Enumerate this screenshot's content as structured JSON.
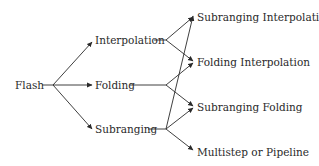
{
  "diagram": {
    "root": {
      "label": "Flash"
    },
    "middle": [
      {
        "label": "Interpolation"
      },
      {
        "label": "Folding"
      },
      {
        "label": "Subranging"
      }
    ],
    "leaves": [
      {
        "label": "Subranging Interpolation"
      },
      {
        "label": "Folding Interpolation"
      },
      {
        "label": "Subranging Folding"
      },
      {
        "label": "Multistep or Pipeline"
      }
    ],
    "edges": [
      {
        "from": "Flash",
        "to": "Interpolation"
      },
      {
        "from": "Flash",
        "to": "Folding"
      },
      {
        "from": "Flash",
        "to": "Subranging"
      },
      {
        "from": "Interpolation",
        "to": "Subranging Interpolation"
      },
      {
        "from": "Interpolation",
        "to": "Folding Interpolation"
      },
      {
        "from": "Folding",
        "to": "Folding Interpolation"
      },
      {
        "from": "Folding",
        "to": "Subranging Folding"
      },
      {
        "from": "Subranging",
        "to": "Subranging Interpolation"
      },
      {
        "from": "Subranging",
        "to": "Subranging Folding"
      },
      {
        "from": "Subranging",
        "to": "Multistep or Pipeline"
      }
    ],
    "colors": {
      "line": "#2a2a2a",
      "text": "#2a2a2a",
      "background": "#ffffff"
    }
  }
}
